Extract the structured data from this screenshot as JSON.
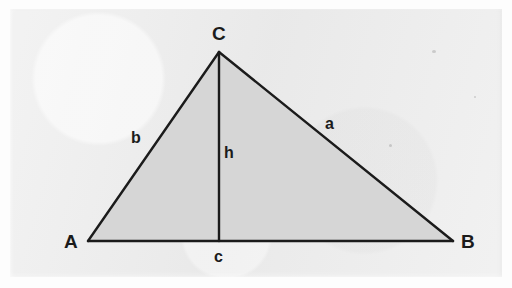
{
  "figure": {
    "kind": "geometry-diagram",
    "colors": {
      "page_background": "#ececec",
      "outer_margin": "#fdfdfd",
      "triangle_fill": "#d6d6d6",
      "stroke": "#1b1b1b",
      "label_text": "#1b1b1b"
    },
    "geometry": {
      "vertices": {
        "A": {
          "x": 88,
          "y": 241
        },
        "B": {
          "x": 453,
          "y": 241
        },
        "C": {
          "x": 219,
          "y": 52
        }
      },
      "altitude_foot": {
        "x": 219,
        "y": 241
      },
      "stroke_width": 2.4
    },
    "vertex_labels": [
      {
        "id": "vertex-label-c",
        "text": "C",
        "x": 212,
        "y": 24
      },
      {
        "id": "vertex-label-a",
        "text": "A",
        "x": 64,
        "y": 232
      },
      {
        "id": "vertex-label-b",
        "text": "B",
        "x": 461,
        "y": 232
      }
    ],
    "side_labels": [
      {
        "id": "side-label-b",
        "text": "b",
        "x": 131,
        "y": 130
      },
      {
        "id": "side-label-a",
        "text": "a",
        "x": 325,
        "y": 116
      },
      {
        "id": "side-label-h",
        "text": "h",
        "x": 224,
        "y": 145
      },
      {
        "id": "side-label-c",
        "text": "c",
        "x": 214,
        "y": 249
      }
    ]
  }
}
